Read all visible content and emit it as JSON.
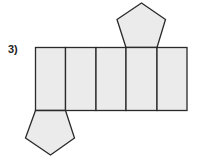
{
  "problem": {
    "label": "3)",
    "figure": "net of a pentagonal prism",
    "faces": {
      "rectangles": 5,
      "pentagons": 2
    },
    "colors": {
      "fill": "#ebebeb",
      "stroke": "#2a2a2a"
    }
  }
}
